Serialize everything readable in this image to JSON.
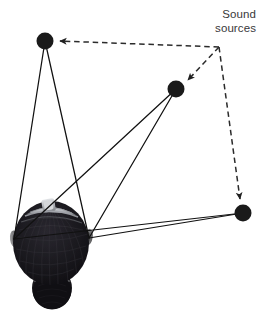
{
  "figure": {
    "background_color": "#ffffff",
    "width": 264,
    "height": 313
  },
  "annotation": {
    "label_line1": "Sound",
    "label_line2": "sources",
    "text_color": "#38383a"
  },
  "colors": {
    "node_fill": "#1a1a1a",
    "solid_line": "#111111",
    "dashed_line": "#2b2b2b",
    "hair_dark": "#17161a",
    "headband_gray": "#b9bcc0",
    "skin_shade": "#6f6f70"
  },
  "chart_data": {
    "type": "diagram",
    "title": "Sound sources",
    "nodes": [
      {
        "id": "source-top-left",
        "label": "Sound source 1",
        "x": 45,
        "y": 41,
        "r": 8.5
      },
      {
        "id": "source-middle",
        "label": "Sound source 2",
        "x": 176,
        "y": 89,
        "r": 8.5
      },
      {
        "id": "source-right",
        "label": "Sound source 3",
        "x": 243,
        "y": 213,
        "r": 8.5
      }
    ],
    "ears": [
      {
        "id": "ear-left",
        "label": "Left ear",
        "x": 14,
        "y": 239
      },
      {
        "id": "ear-right",
        "label": "Right ear",
        "x": 89,
        "y": 238
      }
    ],
    "dashed_vertex": {
      "id": "label-anchor",
      "x": 219,
      "y": 47
    },
    "solid_paths": [
      {
        "from": "source-top-left",
        "to": "ear-left"
      },
      {
        "from": "source-top-left",
        "to": "ear-right"
      },
      {
        "from": "source-middle",
        "to": "ear-left"
      },
      {
        "from": "source-middle",
        "to": "ear-right"
      },
      {
        "from": "source-right",
        "to": "ear-left"
      },
      {
        "from": "source-right",
        "to": "ear-right"
      }
    ],
    "dashed_paths": [
      {
        "from": "label-anchor",
        "to": "source-top-left",
        "arrow": true
      },
      {
        "from": "label-anchor",
        "to": "source-middle",
        "arrow": true
      },
      {
        "from": "label-anchor",
        "to": "source-right",
        "arrow": true
      }
    ],
    "head": {
      "label": "Listener head, top-down view",
      "center_x": 51,
      "center_y": 243,
      "radius_x": 38,
      "radius_y": 42
    },
    "legend_position": "top-right",
    "grid": false
  }
}
